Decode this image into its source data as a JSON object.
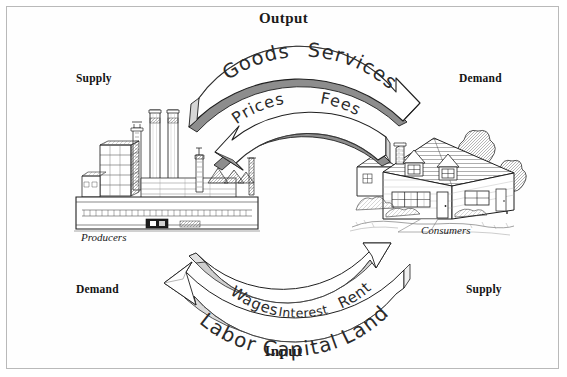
{
  "diagram": {
    "title_top": "Output",
    "title_bottom": "Input",
    "type": "circular-flow-diagram"
  },
  "corner_labels": {
    "top_left": "Supply",
    "top_right": "Demand",
    "bottom_left": "Demand",
    "bottom_right": "Supply"
  },
  "actors": {
    "left": {
      "caption": "Producers",
      "icon": "factory-illustration"
    },
    "right": {
      "caption": "Consumers",
      "icon": "house-illustration"
    }
  },
  "flows": {
    "output_outer": {
      "terms": [
        "Goods",
        "Services"
      ],
      "direction": "left-to-right",
      "from": "Producers",
      "to": "Consumers"
    },
    "output_inner": {
      "terms": [
        "Prices",
        "Fees"
      ],
      "direction": "right-to-left",
      "from": "Consumers",
      "to": "Producers"
    },
    "input_inner": {
      "terms": [
        "Wages",
        "Interest",
        "Dividends",
        "Rent"
      ],
      "direction": "left-to-right",
      "from": "Producers",
      "to": "Consumers"
    },
    "input_outer": {
      "terms": [
        "Labor",
        "Capital",
        "Land"
      ],
      "direction": "right-to-left",
      "from": "Consumers",
      "to": "Producers"
    }
  },
  "arc_text": {
    "goods": "Goods",
    "services": "Services",
    "prices": "Prices",
    "fees": "Fees",
    "wages": "Wages",
    "interest": "Interest",
    "dividends": "Dividends",
    "rent": "Rent",
    "labor": "Labor",
    "capital": "Capital",
    "land": "Land"
  },
  "colors": {
    "border": "#b9b9b9",
    "ink": "#1b1b1b",
    "arrow_face": "#ffffff",
    "arrow_shadow": "#8d8d8d",
    "arrow_shadow_light": "#c9c9c9",
    "background": "#ffffff"
  }
}
